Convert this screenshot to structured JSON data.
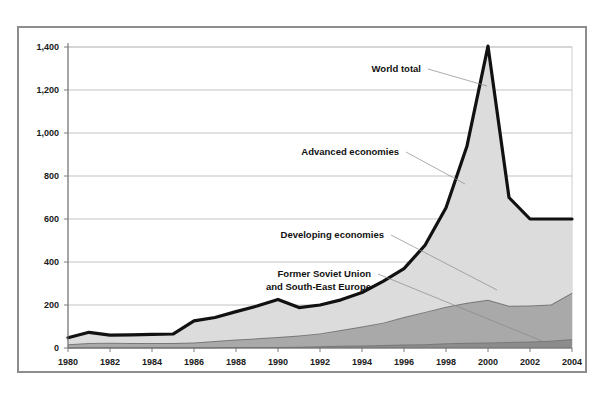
{
  "chart_data": {
    "type": "area",
    "title": "",
    "subtitle": "",
    "xlabel": "",
    "ylabel": "",
    "stacked": true,
    "grid": true,
    "legend_position": "inline-annotations",
    "xlim": [
      1980,
      2004
    ],
    "ylim": [
      0,
      1400
    ],
    "ytick_values": [
      0,
      200,
      400,
      600,
      800,
      1000,
      1200,
      1400
    ],
    "ytick_labels": [
      "0",
      "200",
      "400",
      "600",
      "800",
      "1,000",
      "1,200",
      "1,400"
    ],
    "xtick_values": [
      1980,
      1982,
      1984,
      1986,
      1988,
      1990,
      1992,
      1994,
      1996,
      1998,
      2000,
      2002,
      2004
    ],
    "xtick_labels": [
      "1980",
      "1982",
      "1984",
      "1986",
      "1988",
      "1990",
      "1992",
      "1994",
      "1996",
      "1998",
      "2000",
      "2002",
      "2004"
    ],
    "x": [
      1980,
      1981,
      1982,
      1983,
      1984,
      1985,
      1986,
      1987,
      1988,
      1989,
      1990,
      1991,
      1992,
      1993,
      1994,
      1995,
      1996,
      1997,
      1998,
      1999,
      2000,
      2001,
      2002,
      2003,
      2004
    ],
    "series": [
      {
        "name": "Former Soviet Union and South-East Europe",
        "color": "#8c8c8c",
        "stack_order": 1,
        "values": [
          2,
          3,
          3,
          3,
          3,
          3,
          4,
          4,
          5,
          5,
          5,
          6,
          8,
          10,
          12,
          14,
          16,
          18,
          22,
          24,
          26,
          28,
          30,
          34,
          42
        ]
      },
      {
        "name": "Developing economies",
        "color": "#a9a9a9",
        "stack_order": 2,
        "values": [
          16,
          20,
          22,
          20,
          20,
          20,
          22,
          28,
          34,
          40,
          46,
          52,
          60,
          74,
          88,
          104,
          128,
          150,
          170,
          186,
          198,
          168,
          168,
          168,
          215
        ]
      },
      {
        "name": "Advanced economies",
        "color": "#dcdcdc",
        "stack_order": 3,
        "values": [
          30,
          50,
          35,
          38,
          40,
          42,
          100,
          110,
          130,
          150,
          175,
          130,
          132,
          140,
          158,
          192,
          225,
          310,
          460,
          730,
          1180,
          504,
          402,
          398,
          343
        ]
      }
    ],
    "total_line": {
      "name": "World total",
      "color": "#111111",
      "values": [
        48,
        73,
        60,
        61,
        63,
        65,
        126,
        142,
        169,
        195,
        226,
        188,
        200,
        224,
        258,
        310,
        369,
        478,
        652,
        940,
        1404,
        700,
        600,
        600,
        600
      ]
    },
    "annotations": [
      {
        "label": "World total",
        "target_series": "total_line"
      },
      {
        "label": "Advanced economies",
        "target_series": "Advanced economies"
      },
      {
        "label": "Developing economies",
        "target_series": "Developing economies"
      },
      {
        "label": "Former Soviet Union",
        "target_series": "Former Soviet Union and South-East Europe"
      },
      {
        "label": "and South-East Europe",
        "target_series": "Former Soviet Union and South-East Europe"
      }
    ]
  },
  "annotation_labels": {
    "world_total": "World total",
    "advanced": "Advanced economies",
    "developing": "Developing economies",
    "fsu_line1": "Former Soviet Union",
    "fsu_line2": "and South-East Europe"
  }
}
